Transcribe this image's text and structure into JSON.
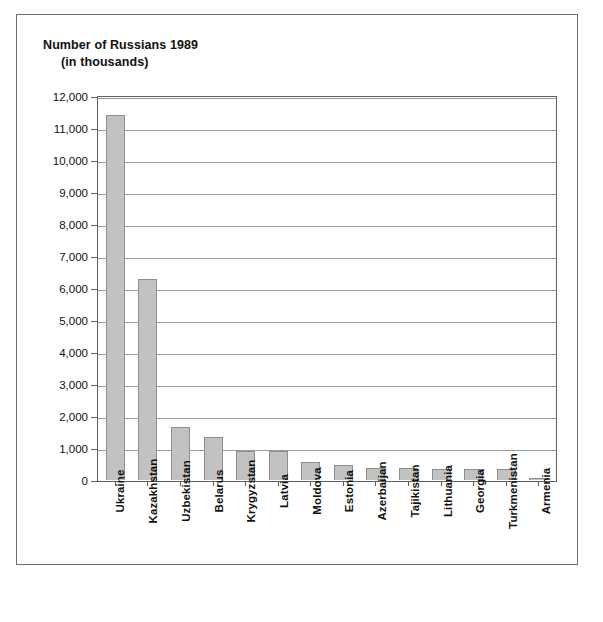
{
  "chart_data": {
    "type": "bar",
    "title": "Number of Russians 1989",
    "subtitle": "(in thousands)",
    "xlabel": "",
    "ylabel": "",
    "ylim": [
      0,
      12000
    ],
    "grid": true,
    "legend": "none",
    "y_ticks": [
      "12,000",
      "11,000",
      "10,000",
      "9,000",
      "8,000",
      "7,000",
      "6,000",
      "5,000",
      "4,000",
      "3,000",
      "2,000",
      "1,000",
      "0"
    ],
    "y_tick_values": [
      12000,
      11000,
      10000,
      9000,
      8000,
      7000,
      6000,
      5000,
      4000,
      3000,
      2000,
      1000,
      0
    ],
    "categories": [
      "Ukraine",
      "Kazakhstan",
      "Uzbekistan",
      "Belarus",
      "Krygyzstan",
      "Latvia",
      "Moldova",
      "Estonia",
      "Azerbaijan",
      "Tajikistan",
      "Lithuania",
      "Georgia",
      "Turkmenistan",
      "Armenia"
    ],
    "values": [
      11400,
      6280,
      1650,
      1340,
      920,
      910,
      560,
      470,
      390,
      390,
      340,
      340,
      330,
      50
    ],
    "bar_color": "#c2c2c2",
    "bar_border_color": "#8e8e8e",
    "grid_color": "#9a9a9a",
    "axis_color": "#5f5f5f"
  },
  "caption": {
    "text": ""
  }
}
